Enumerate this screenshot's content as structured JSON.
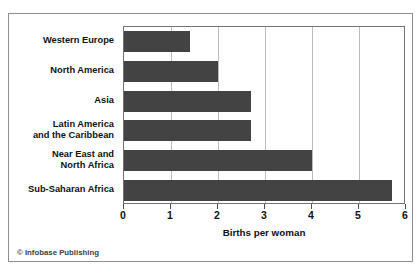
{
  "credit": "© Infobase Publishing",
  "chart_data": {
    "type": "bar",
    "orientation": "horizontal",
    "title": "",
    "xlabel": "Births per woman",
    "ylabel": "",
    "xlim": [
      0,
      6
    ],
    "ylim": null,
    "grid": true,
    "legend": null,
    "bar_color": "#434343",
    "gridline_color": "#b9bdc0",
    "frame_color": "#6f7478",
    "xticks": [
      0,
      1,
      2,
      3,
      4,
      5,
      6
    ],
    "xtick_labels": [
      "0",
      "1",
      "2",
      "3",
      "4",
      "5",
      "6"
    ],
    "categories": [
      "Western Europe",
      "North America",
      "Asia",
      "Latin America and the Caribbean",
      "Near East and North Africa",
      "Sub-Saharan Africa"
    ],
    "category_label_lines": [
      [
        "Western Europe"
      ],
      [
        "North America"
      ],
      [
        "Asia"
      ],
      [
        "Latin America",
        "and the Caribbean"
      ],
      [
        "Near East and",
        "North Africa"
      ],
      [
        "Sub-Saharan Africa"
      ]
    ],
    "values": [
      1.4,
      2.0,
      2.7,
      2.7,
      4.0,
      5.7
    ]
  }
}
